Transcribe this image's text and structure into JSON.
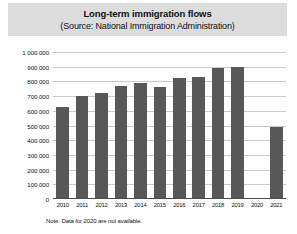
{
  "title": {
    "main": "Long-term immigration flows",
    "sub": "(Source: National Immigration Administration)"
  },
  "note": "Note: Data for 2020 are not available.",
  "colors": {
    "bar": "#585858",
    "title_band": "#dcdcdc",
    "gridline": "#c9c9c9",
    "axis": "#4a4a4a",
    "text": "#111111"
  },
  "chart_data": {
    "type": "bar",
    "title": "Long-term immigration flows",
    "subtitle": "(Source: National Immigration Administration)",
    "xlabel": "",
    "ylabel": "",
    "ylim": [
      0,
      1000000
    ],
    "ytick_step": 100000,
    "grid": true,
    "legend": "none",
    "annotation": "Note: Data for 2020 are not available.",
    "categories": [
      "2010",
      "2011",
      "2012",
      "2013",
      "2014",
      "2015",
      "2016",
      "2017",
      "2018",
      "2019",
      "2020",
      "2021"
    ],
    "ytick_labels": [
      "0",
      "100 000",
      "200 000",
      "300 000",
      "400 000",
      "500 000",
      "600 000",
      "700 000",
      "800 000",
      "900 000",
      "1 000 000"
    ],
    "ytick_values": [
      0,
      100000,
      200000,
      300000,
      400000,
      500000,
      600000,
      700000,
      800000,
      900000,
      1000000
    ],
    "values": [
      625000,
      700000,
      720000,
      770000,
      790000,
      760000,
      820000,
      830000,
      890000,
      895000,
      null,
      490000
    ]
  }
}
